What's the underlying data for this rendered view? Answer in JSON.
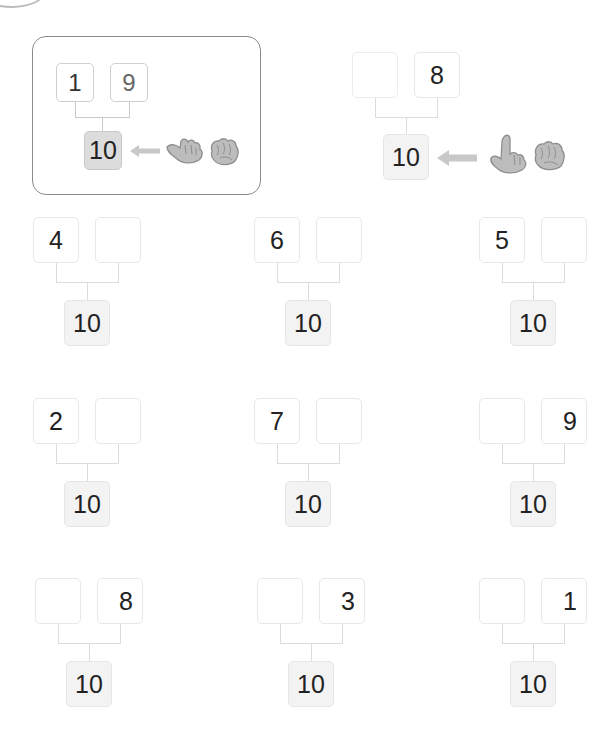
{
  "examples": [
    {
      "name": "example-boxed",
      "parts": [
        "1",
        "9"
      ],
      "whole": "10",
      "hint": "nine-fingers-pointing-left"
    },
    {
      "name": "example-plain",
      "parts": [
        "",
        "8"
      ],
      "whole": "10",
      "hint": "eight-fingers-pointing-left"
    }
  ],
  "problems": [
    {
      "parts": [
        "4",
        ""
      ],
      "whole": "10"
    },
    {
      "parts": [
        "6",
        ""
      ],
      "whole": "10"
    },
    {
      "parts": [
        "5",
        ""
      ],
      "whole": "10"
    },
    {
      "parts": [
        "2",
        ""
      ],
      "whole": "10"
    },
    {
      "parts": [
        "7",
        ""
      ],
      "whole": "10"
    },
    {
      "parts": [
        "",
        "9"
      ],
      "whole": "10"
    },
    {
      "parts": [
        "",
        "8"
      ],
      "whole": "10"
    },
    {
      "parts": [
        "",
        "3"
      ],
      "whole": "10"
    },
    {
      "parts": [
        "",
        "1"
      ],
      "whole": "10"
    }
  ],
  "colors": {
    "box_border": "#e8e8e8",
    "whole_fill": "#f3f3f3",
    "example_whole_fill": "#dcdcdc",
    "frame_border": "#8a8a8a",
    "icon_gray": "#a8a8a8"
  }
}
